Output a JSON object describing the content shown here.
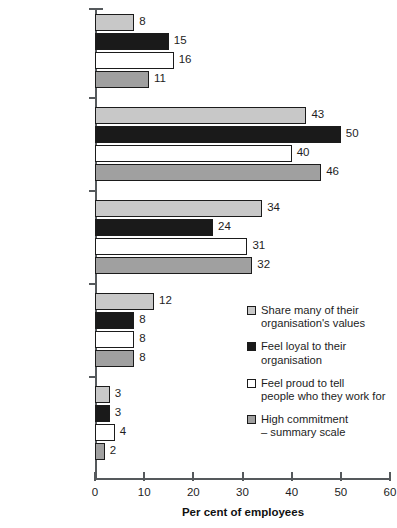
{
  "chart_data": {
    "type": "bar",
    "orientation": "horizontal",
    "title": "",
    "xlabel": "Per cent of employees",
    "ylabel": "",
    "xlim": [
      0,
      60
    ],
    "xticks": [
      0,
      10,
      20,
      30,
      40,
      50,
      60
    ],
    "grid": false,
    "legend_position": "middle-right",
    "categories": [
      "Strongly agree",
      "Agree",
      "Neither agree\nnor disagree",
      "Disagree",
      "Strongly disagree"
    ],
    "series": [
      {
        "name": "Share many of their\norganisation's values",
        "color": "#c8c8c8",
        "values": [
          8,
          43,
          34,
          12,
          3
        ]
      },
      {
        "name": "Feel loyal to their\norganisation",
        "color": "#1a1a1a",
        "values": [
          15,
          50,
          24,
          8,
          3
        ]
      },
      {
        "name": "Feel proud to tell\npeople who they work for",
        "color": "#ffffff",
        "values": [
          16,
          40,
          31,
          8,
          4
        ]
      },
      {
        "name": "High commitment\n– summary scale",
        "color": "#a0a0a0",
        "values": [
          11,
          46,
          32,
          8,
          2
        ]
      }
    ]
  },
  "axis": {
    "tick_labels": [
      "0",
      "10",
      "20",
      "30",
      "40",
      "50",
      "60"
    ],
    "x_title": "Per cent of employees"
  },
  "legend": {
    "items": [
      {
        "label": "Share many of their\norganisation's values",
        "swatch": "#c8c8c8"
      },
      {
        "label": "Feel loyal to their\norganisation",
        "swatch": "#1a1a1a"
      },
      {
        "label": "Feel proud to tell\npeople who they work for",
        "swatch": "#ffffff"
      },
      {
        "label": "High commitment\n– summary scale",
        "swatch": "#a0a0a0"
      }
    ]
  }
}
